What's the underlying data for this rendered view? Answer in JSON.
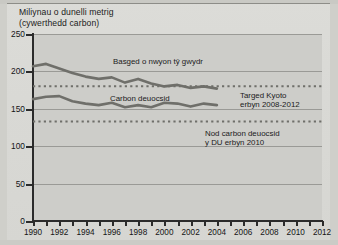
{
  "title": "Miliynau o dunelli metrig\n(cywerthedd carbon)",
  "annotations": {
    "ghg": "Basged o nwyon tŷ gwydr",
    "co2": "Carbon deuocsid",
    "kyoto": "Targed Kyoto\nerbyn 2008-2012",
    "uk_target": "Nod carbon deuocsid\ny DU erbyn 2010"
  },
  "colors": {
    "line": "#6f6f6a",
    "axis": "#2b2b2b",
    "plot_bg": "#cdcdc9",
    "grid": "#9a9a96",
    "page_bg": "#d8d8d4"
  },
  "chart_data": {
    "type": "line",
    "title": "Miliynau o dunelli metrig (cywerthedd carbon)",
    "xlabel": "",
    "ylabel": "Miliynau o dunelli metrig (cywerthedd carbon)",
    "xlim": [
      1990,
      2012
    ],
    "ylim": [
      0,
      250
    ],
    "yticks": [
      0,
      50,
      100,
      150,
      200,
      250
    ],
    "xticks": [
      1990,
      1991,
      1992,
      1993,
      1994,
      1995,
      1996,
      1997,
      1998,
      1999,
      2000,
      2001,
      2002,
      2003,
      2004,
      2005,
      2006,
      2007,
      2008,
      2009,
      2010,
      2011,
      2012
    ],
    "xtick_labels": [
      "1990",
      "1992",
      "1994",
      "1996",
      "1998",
      "2000",
      "2002",
      "2004",
      "2006",
      "2008",
      "2010",
      "2012"
    ],
    "grid": true,
    "legend": "none (inline annotations)",
    "series": [
      {
        "name": "Basged o nwyon tŷ gwydr",
        "x": [
          1990,
          1991,
          1992,
          1993,
          1994,
          1995,
          1996,
          1997,
          1998,
          1999,
          2000,
          2001,
          2002,
          2003,
          2004
        ],
        "values": [
          207,
          210,
          204,
          198,
          193,
          190,
          192,
          185,
          190,
          184,
          180,
          182,
          178,
          180,
          177
        ]
      },
      {
        "name": "Carbon deuocsid",
        "x": [
          1990,
          1991,
          1992,
          1993,
          1994,
          1995,
          1996,
          1997,
          1998,
          1999,
          2000,
          2001,
          2002,
          2003,
          2004
        ],
        "values": [
          163,
          166,
          167,
          160,
          157,
          155,
          158,
          152,
          155,
          152,
          158,
          157,
          153,
          157,
          155
        ]
      }
    ],
    "reference_lines": [
      {
        "name": "Targed Kyoto erbyn 2008-2012",
        "value": 180,
        "style": "dashed",
        "x_from": 1990,
        "x_to": 2012
      },
      {
        "name": "Nod carbon deuocsid y DU erbyn 2010",
        "value": 133,
        "style": "dashed",
        "x_from": 1990,
        "x_to": 2012
      }
    ]
  }
}
